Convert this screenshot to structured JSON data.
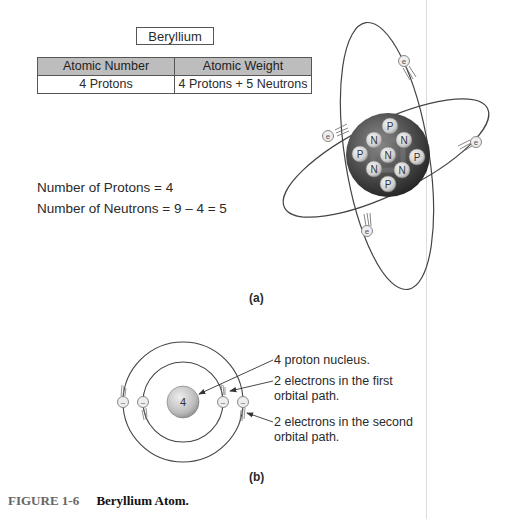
{
  "figure_a": {
    "element_name": "Beryllium",
    "table": {
      "headers": [
        "Atomic Number",
        "Atomic Weight"
      ],
      "rows": [
        [
          "4 Protons",
          "4 Protons + 5 Neutrons"
        ]
      ]
    },
    "equations": {
      "protons": "Number of Protons = 4",
      "neutrons": "Number of Neutrons = 9 – 4 = 5"
    },
    "nucleus_particles": [
      "P",
      "N",
      "N",
      "P",
      "N",
      "P",
      "N",
      "N",
      "P"
    ],
    "electron_symbol": "e",
    "panel_label": "(a)"
  },
  "figure_b": {
    "nucleus_label": "4",
    "electron_symbol": "–",
    "callouts": [
      {
        "line1": "4 proton nucleus.",
        "line2": ""
      },
      {
        "line1": "2 electrons in the first",
        "line2": "orbital path."
      },
      {
        "line1": "2 electrons in the second",
        "line2": "orbital path."
      }
    ],
    "panel_label": "(b)"
  },
  "caption": {
    "figure_number": "FIGURE 1-6",
    "title": "Beryllium Atom."
  },
  "colors": {
    "table_header_bg": "#bdbdbd",
    "nucleus_dark": "#3a3a3a",
    "particle_light": "#d8d8d8",
    "orbit_line": "#444444"
  }
}
